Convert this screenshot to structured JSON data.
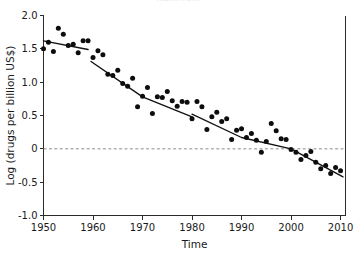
{
  "figure": {
    "cut_off_title": "Overall trend",
    "background_color": "#ffffff",
    "point_color": "#0d0d0d",
    "line_color": "#111111",
    "zero_line_color": "#8c8c8c"
  },
  "chart_data": {
    "type": "scatter",
    "title": "",
    "xlabel": "Time",
    "ylabel": "Log (drugs per billion US$)",
    "xlim": [
      1950,
      2011
    ],
    "ylim": [
      -1.0,
      2.0
    ],
    "xticks": [
      1950,
      1960,
      1970,
      1980,
      1990,
      2000,
      2010
    ],
    "xticklabels": [
      "1950",
      "1960",
      "1970",
      "1980",
      "1990",
      "2000",
      "2010"
    ],
    "yticks": [
      -1.0,
      -0.5,
      0,
      0.5,
      1.0,
      1.5,
      2.0
    ],
    "yticklabels": [
      "-1.0",
      "-0.5",
      "0",
      "0.5",
      "1.0",
      "1.5",
      "2.0"
    ],
    "grid": false,
    "legend": null,
    "annotations": [
      {
        "name": "zero-reference-line",
        "type": "hline",
        "y": 0,
        "style": "dashed"
      }
    ],
    "series": [
      {
        "name": "Log drugs approved per billion US$ R&D",
        "marker": "filled-circle",
        "x": [
          1950,
          1951,
          1952,
          1953,
          1954,
          1955,
          1956,
          1957,
          1958,
          1959,
          1960,
          1961,
          1962,
          1963,
          1964,
          1965,
          1966,
          1967,
          1968,
          1969,
          1970,
          1971,
          1972,
          1973,
          1974,
          1975,
          1976,
          1977,
          1978,
          1979,
          1980,
          1981,
          1982,
          1983,
          1984,
          1985,
          1986,
          1987,
          1988,
          1989,
          1990,
          1991,
          1992,
          1993,
          1994,
          1995,
          1996,
          1997,
          1998,
          1999,
          2000,
          2001,
          2002,
          2003,
          2004,
          2005,
          2006,
          2007,
          2008,
          2009,
          2010
        ],
        "y": [
          1.5,
          1.6,
          1.46,
          1.81,
          1.72,
          1.55,
          1.57,
          1.44,
          1.62,
          1.62,
          1.37,
          1.47,
          1.41,
          1.12,
          1.1,
          1.18,
          0.98,
          0.94,
          1.06,
          0.63,
          0.79,
          0.92,
          0.53,
          0.78,
          0.77,
          0.86,
          0.72,
          0.64,
          0.71,
          0.7,
          0.45,
          0.71,
          0.63,
          0.29,
          0.48,
          0.55,
          0.41,
          0.45,
          0.14,
          0.28,
          0.3,
          0.17,
          0.23,
          0.13,
          -0.05,
          0.11,
          0.38,
          0.27,
          0.15,
          0.14,
          -0.01,
          -0.05,
          -0.16,
          -0.1,
          -0.04,
          -0.2,
          -0.3,
          -0.25,
          -0.37,
          -0.28,
          -0.33
        ]
      }
    ],
    "trend_lines": [
      {
        "name": "trend-segment-1950-1959",
        "points": [
          [
            1950,
            1.62
          ],
          [
            1959,
            1.49
          ]
        ]
      },
      {
        "name": "trend-segment-1960-1980",
        "points": [
          [
            1959.6,
            1.31
          ],
          [
            1970,
            0.78
          ],
          [
            1980,
            0.48
          ]
        ]
      },
      {
        "name": "trend-segment-1980-2010",
        "points": [
          [
            1980,
            0.52
          ],
          [
            1990,
            0.17
          ],
          [
            2000,
            0.0
          ],
          [
            2010.5,
            -0.42
          ]
        ]
      }
    ]
  }
}
